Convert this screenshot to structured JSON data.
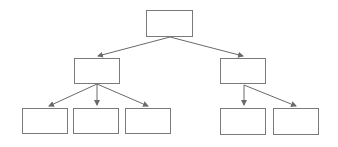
{
  "diagram": {
    "type": "tree-hierarchy",
    "colors": {
      "node_border": "#7a7a7a",
      "node_fill": "#ffffff",
      "edge": "#6a6a6a",
      "background": "#ffffff"
    },
    "nodes": [
      {
        "id": "root",
        "label": "",
        "level": 0,
        "x": 146,
        "y": 10,
        "w": 47,
        "h": 27
      },
      {
        "id": "left",
        "label": "",
        "level": 1,
        "x": 74,
        "y": 58,
        "w": 46,
        "h": 26
      },
      {
        "id": "right",
        "label": "",
        "level": 1,
        "x": 220,
        "y": 58,
        "w": 46,
        "h": 26
      },
      {
        "id": "left-1",
        "label": "",
        "level": 2,
        "x": 22,
        "y": 108,
        "w": 46,
        "h": 26
      },
      {
        "id": "left-2",
        "label": "",
        "level": 2,
        "x": 73,
        "y": 108,
        "w": 46,
        "h": 26
      },
      {
        "id": "left-3",
        "label": "",
        "level": 2,
        "x": 125,
        "y": 108,
        "w": 46,
        "h": 26
      },
      {
        "id": "right-1",
        "label": "",
        "level": 2,
        "x": 220,
        "y": 108,
        "w": 46,
        "h": 27
      },
      {
        "id": "right-2",
        "label": "",
        "level": 2,
        "x": 273,
        "y": 108,
        "w": 46,
        "h": 27
      }
    ],
    "edges": [
      {
        "from": "root",
        "to": "left",
        "x1": 170,
        "y1": 37,
        "x2": 98,
        "y2": 56
      },
      {
        "from": "root",
        "to": "right",
        "x1": 170,
        "y1": 37,
        "x2": 243,
        "y2": 56
      },
      {
        "from": "left",
        "to": "left-1",
        "x1": 97,
        "y1": 84,
        "x2": 49,
        "y2": 106
      },
      {
        "from": "left",
        "to": "left-2",
        "x1": 97,
        "y1": 84,
        "x2": 97,
        "y2": 105
      },
      {
        "from": "left",
        "to": "left-3",
        "x1": 97,
        "y1": 84,
        "x2": 148,
        "y2": 106
      },
      {
        "from": "right",
        "to": "right-1",
        "x1": 244,
        "y1": 85,
        "x2": 244,
        "y2": 105
      },
      {
        "from": "right",
        "to": "right-2",
        "x1": 244,
        "y1": 85,
        "x2": 296,
        "y2": 106
      }
    ]
  }
}
